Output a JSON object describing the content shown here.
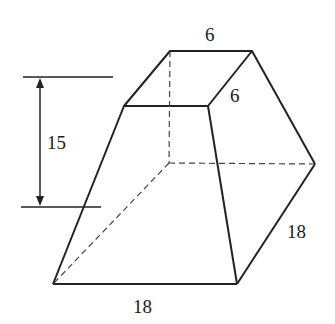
{
  "figure": {
    "type": "frustum of a square pyramid",
    "labels": {
      "top_back_edge": "6",
      "top_side_edge": "6",
      "height": "15",
      "bottom_side_edge": "18",
      "bottom_front_edge": "18"
    },
    "colors": {
      "line": "#222222",
      "background": "#ffffff"
    }
  }
}
